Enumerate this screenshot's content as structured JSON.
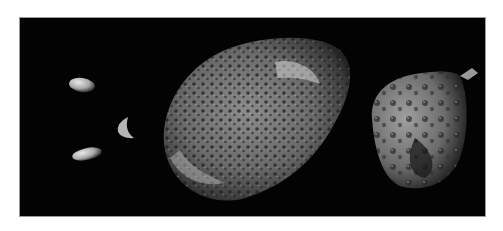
{
  "image": {
    "description": "Composite photograph of small irregular moons against black space",
    "background_color": "#030303",
    "frame_color": "#9a9a9a",
    "objects": [
      {
        "name": "small-moon-1",
        "shape": "elongated oval"
      },
      {
        "name": "small-moon-2",
        "shape": "crescent-lit fragment"
      },
      {
        "name": "small-moon-3",
        "shape": "elongated oval"
      },
      {
        "name": "large-cratered-moon",
        "shape": "sponge-like elongated potato"
      },
      {
        "name": "right-cratered-moon",
        "shape": "rounded cratered body"
      }
    ]
  }
}
